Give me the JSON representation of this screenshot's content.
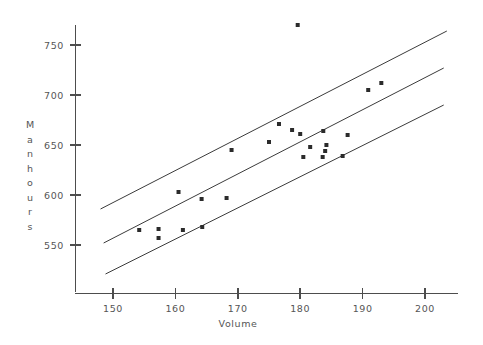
{
  "chart_data": {
    "type": "scatter",
    "title": "",
    "xlabel": "Volume",
    "ylabel": "Manhours",
    "xlim": [
      146,
      206
    ],
    "ylim": [
      521,
      776
    ],
    "grid": false,
    "legend": null,
    "xticks": [
      150,
      160,
      170,
      180,
      190,
      200
    ],
    "xtick_labels": [
      "150",
      "160",
      "170",
      "180",
      "190",
      "200"
    ],
    "yticks": [
      550,
      600,
      650,
      700,
      750
    ],
    "ytick_labels": [
      "550",
      "600",
      "650",
      "700",
      "750"
    ],
    "points": [
      {
        "x": 154.2,
        "y": 565.0
      },
      {
        "x": 157.3,
        "y": 566.0
      },
      {
        "x": 157.3,
        "y": 557.0
      },
      {
        "x": 161.2,
        "y": 565.0
      },
      {
        "x": 164.3,
        "y": 568.0
      },
      {
        "x": 160.5,
        "y": 603.0
      },
      {
        "x": 164.2,
        "y": 596.0
      },
      {
        "x": 168.2,
        "y": 597.0
      },
      {
        "x": 169.0,
        "y": 645.0
      },
      {
        "x": 175.0,
        "y": 653.0
      },
      {
        "x": 176.6,
        "y": 671.0
      },
      {
        "x": 178.7,
        "y": 665.0
      },
      {
        "x": 180.0,
        "y": 661.0
      },
      {
        "x": 183.7,
        "y": 664.0
      },
      {
        "x": 187.6,
        "y": 660.0
      },
      {
        "x": 181.6,
        "y": 648.0
      },
      {
        "x": 184.2,
        "y": 650.0
      },
      {
        "x": 180.5,
        "y": 638.0
      },
      {
        "x": 183.6,
        "y": 638.0
      },
      {
        "x": 186.8,
        "y": 639.0
      },
      {
        "x": 184.0,
        "y": 644.0
      },
      {
        "x": 190.9,
        "y": 705.0
      },
      {
        "x": 193.0,
        "y": 712.0
      },
      {
        "x": 179.6,
        "y": 770.0
      }
    ],
    "band_lines": [
      {
        "name": "upper-limit-line",
        "x1": 148.0,
        "y1": 586.0,
        "x2": 203.5,
        "y2": 764.0
      },
      {
        "name": "center-regression-line",
        "x1": 148.5,
        "y1": 552.0,
        "x2": 203.0,
        "y2": 727.0
      },
      {
        "name": "lower-limit-line",
        "x1": 148.8,
        "y1": 521.0,
        "x2": 203.0,
        "y2": 690.0
      }
    ],
    "colors": {
      "point": "#2b2b2b",
      "axis": "#4d4d4d",
      "band": "#3b3b3b",
      "text": "#555555",
      "background": "#ffffff"
    }
  }
}
